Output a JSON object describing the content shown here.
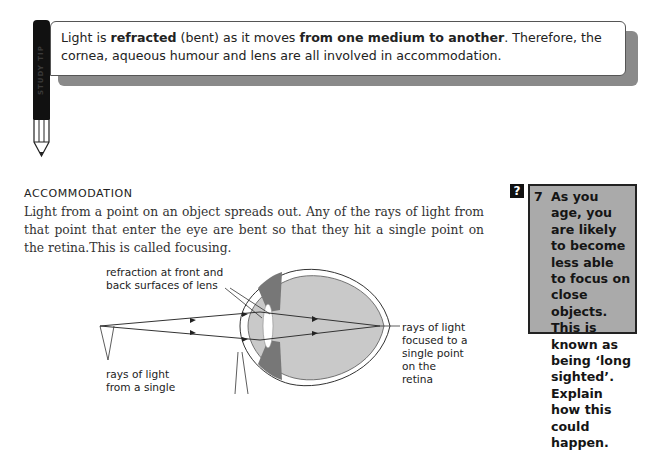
{
  "tip": {
    "icon": "pencil-icon",
    "pencil_label": "STUDY TIP",
    "segments": [
      {
        "text": "Light is ",
        "bold": false
      },
      {
        "text": "refracted",
        "bold": true
      },
      {
        "text": " (bent) as it moves ",
        "bold": false
      },
      {
        "text": "from one medium to another",
        "bold": true
      },
      {
        "text": ". Therefore, the cornea, aqueous humour and lens are all involved in accommodation.",
        "bold": false
      }
    ]
  },
  "section": {
    "heading": "ACCOMMODATION",
    "body": "Light from a point on an object spreads out. Any of the rays of light from that point that enter the eye are bent so that they hit a single point on the retina.This is called focusing."
  },
  "question": {
    "icon": "question-mark-icon",
    "icon_glyph": "?",
    "number": "7",
    "text": "As you age, you are likely to become less able to focus on close objects. This is known as being ‘long sighted’. Explain how this could happen."
  },
  "diagram": {
    "labels": {
      "refraction": "refraction at front and back surfaces of lens",
      "rays_source": "rays of light from a single",
      "rays_focused": "rays of light focused to a single point on the retina"
    }
  }
}
